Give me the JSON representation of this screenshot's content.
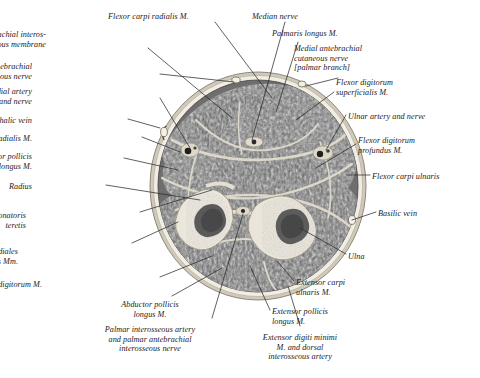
{
  "plate": {
    "kind": "anatomical-cross-section",
    "region": "right forearm, transverse section, middle third",
    "background_color": "#ffffff",
    "ink_color": "#1b1b1b",
    "palette": {
      "skin_rim": "#d8d2c6",
      "subcutaneous": "#efeae0",
      "muscle_dark": "#6f6f6f",
      "muscle_mid": "#7d7d7d",
      "muscle_light": "#8d8d8d",
      "fascia": "#cfcabd",
      "septum": "#ded9cc",
      "bone_cortex": "#e9e5dc",
      "bone_marrow": "#565656",
      "vessel_dark": "#2a2a2a",
      "leader_line": "#2b2b2b"
    }
  },
  "labels": [
    {
      "id": "flexor-carpi-radialis",
      "text": "Flexor carpi radialis M.",
      "align": "left",
      "x": 108,
      "y": 12,
      "lines": 1
    },
    {
      "id": "median-nerve",
      "text": "Median nerve",
      "align": "left",
      "x": 252,
      "y": 12,
      "lines": 1
    },
    {
      "id": "antebrachial-interosseous-membrane",
      "text": "Antebrachial interos-\nseous membrane",
      "align": "right",
      "x": 46,
      "y": 30,
      "lines": 2
    },
    {
      "id": "palmaris-longus",
      "text": "Palmaris longus M.",
      "align": "left",
      "x": 272,
      "y": 29,
      "lines": 1
    },
    {
      "id": "medial-antebrachial-cutaneous-nerve",
      "text": "Medial antebrachial\ncutaneous nerve\n[palmar branch]",
      "align": "left",
      "x": 294,
      "y": 44,
      "lines": 3
    },
    {
      "id": "lateral-antebrachial-cutaneous-nerve",
      "text": "Lateral antebrachial\ncutaneous nerve",
      "align": "right",
      "x": 32,
      "y": 62,
      "lines": 2
    },
    {
      "id": "flexor-digitorum-superficialis",
      "text": "Flexor digitorum\nsuperficialis M.",
      "align": "left",
      "x": 336,
      "y": 78,
      "lines": 2
    },
    {
      "id": "radial-artery-and-nerve",
      "text": "Radial artery\nand nerve",
      "align": "right",
      "x": 32,
      "y": 87,
      "lines": 2
    },
    {
      "id": "cephalic-vein",
      "text": "Cephalic vein",
      "align": "right",
      "x": 32,
      "y": 116,
      "lines": 1
    },
    {
      "id": "ulnar-artery-and-nerve",
      "text": "Ulnar artery and nerve",
      "align": "left",
      "x": 348,
      "y": 112,
      "lines": 1
    },
    {
      "id": "brachioradialis",
      "text": "Brachioradialis M.",
      "align": "right",
      "x": 32,
      "y": 134,
      "lines": 1
    },
    {
      "id": "flexor-digitorum-profundus",
      "text": "Flexor digitorum\nprofundus M.",
      "align": "left",
      "x": 358,
      "y": 136,
      "lines": 2
    },
    {
      "id": "flexor-pollicis-longus",
      "text": "Flexor pollicis\nlongus M.",
      "align": "right",
      "x": 32,
      "y": 152,
      "lines": 2
    },
    {
      "id": "flexor-carpi-ulnaris",
      "text": "Flexor carpi ulnaris",
      "align": "left",
      "x": 372,
      "y": 172,
      "lines": 1
    },
    {
      "id": "radius",
      "text": "Radius",
      "align": "right",
      "x": 32,
      "y": 182,
      "lines": 1
    },
    {
      "id": "tendo-m-pronatoris-teretis",
      "text": "Tendo m. pronatoris\nteretis",
      "align": "right",
      "x": 26,
      "y": 211,
      "lines": 2
    },
    {
      "id": "basilic-vein",
      "text": "Basilic vein",
      "align": "left",
      "x": 378,
      "y": 209,
      "lines": 1
    },
    {
      "id": "extensores-carpi-radiales",
      "text": "Extensores carpi radiales\nlongus and brevis Mm.",
      "align": "right",
      "x": 18,
      "y": 247,
      "lines": 2
    },
    {
      "id": "ulna",
      "text": "Ulna",
      "align": "left",
      "x": 348,
      "y": 252,
      "lines": 1
    },
    {
      "id": "extensor-digitorum",
      "text": "Extensor digitorum M.",
      "align": "right",
      "x": 42,
      "y": 280,
      "lines": 1
    },
    {
      "id": "extensor-carpi-ulnaris",
      "text": "Extensor carpi\nulnaris M.",
      "align": "left",
      "x": 296,
      "y": 278,
      "lines": 2
    },
    {
      "id": "abductor-pollicis-longus",
      "text": "Abductor pollicis\nlongus M.",
      "align": "center",
      "x": 150,
      "y": 300,
      "lines": 2
    },
    {
      "id": "extensor-pollicis-longus",
      "text": "Extensor pollicis\nlongus M.",
      "align": "left",
      "x": 272,
      "y": 307,
      "lines": 2
    },
    {
      "id": "palmar-interosseous-artery",
      "text": "Palmar interosseous artery\nand palmar antebrachial\ninterosseous nerve",
      "align": "center",
      "x": 150,
      "y": 325,
      "lines": 3
    },
    {
      "id": "extensor-digiti-minimi",
      "text": "Extensor digiti minimi\nM. and dorsal\ninterosseous artery",
      "align": "center",
      "x": 300,
      "y": 333,
      "lines": 3
    }
  ],
  "structures": [
    {
      "id": "skin-and-subcutaneous-rim",
      "name": "skin and subcutaneous fat rim"
    },
    {
      "id": "radius-bone",
      "name": "Radius"
    },
    {
      "id": "ulna-bone",
      "name": "Ulna"
    },
    {
      "id": "interosseous-membrane",
      "name": "Antebrachial interosseous membrane"
    },
    {
      "id": "flexor-compartment",
      "name": "anterior (flexor) muscle compartment"
    },
    {
      "id": "extensor-compartment",
      "name": "posterior (extensor) muscle compartment"
    },
    {
      "id": "radial-vessel-bundle",
      "name": "radial artery and nerve bundle"
    },
    {
      "id": "ulnar-vessel-bundle",
      "name": "ulnar artery and nerve bundle"
    },
    {
      "id": "median-nerve-bundle",
      "name": "median nerve"
    },
    {
      "id": "cephalic-vein-lumen",
      "name": "cephalic vein"
    },
    {
      "id": "basilic-vein-lumen",
      "name": "basilic vein"
    },
    {
      "id": "interosseous-bundle",
      "name": "palmar interosseous vessels and nerve"
    }
  ],
  "footer": {
    "cut_off_text": ""
  }
}
